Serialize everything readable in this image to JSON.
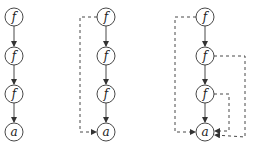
{
  "diagrams": [
    {
      "id": "left",
      "nodes": [
        {
          "label": "f",
          "x": 14,
          "y": 17
        },
        {
          "label": "f",
          "x": 14,
          "y": 56
        },
        {
          "label": "f",
          "x": 14,
          "y": 94
        },
        {
          "label": "a",
          "x": 14,
          "y": 132
        }
      ]
    },
    {
      "id": "middle",
      "nodes": [
        {
          "label": "f",
          "x": 106,
          "y": 17
        },
        {
          "label": "f",
          "x": 106,
          "y": 56
        },
        {
          "label": "f",
          "x": 106,
          "y": 94
        },
        {
          "label": "a",
          "x": 106,
          "y": 132
        }
      ]
    },
    {
      "id": "right",
      "nodes": [
        {
          "label": "f",
          "x": 205,
          "y": 17
        },
        {
          "label": "f",
          "x": 205,
          "y": 56
        },
        {
          "label": "f",
          "x": 205,
          "y": 94
        },
        {
          "label": "a",
          "x": 205,
          "y": 132
        }
      ]
    }
  ]
}
